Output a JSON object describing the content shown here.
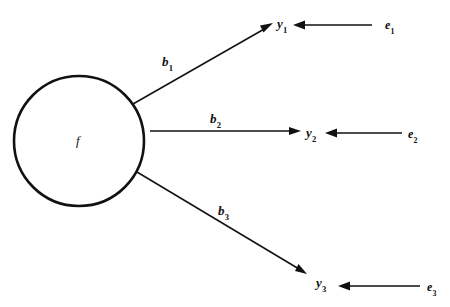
{
  "diagram": {
    "type": "path-diagram",
    "background_color": "#ffffff",
    "stroke_color": "#111111",
    "factor": {
      "name": "f",
      "label": "f",
      "shape": "circle",
      "cx": 79,
      "cy": 141,
      "r": 65,
      "stroke_width": 2.6
    },
    "loadings": [
      {
        "name": "b1",
        "label": "b",
        "subscript": "1",
        "from": "f",
        "to": "y1",
        "x1": 133,
        "y1": 104,
        "x2": 273,
        "y2": 23,
        "label_x": 162,
        "label_y": 55
      },
      {
        "name": "b2",
        "label": "b",
        "subscript": "2",
        "from": "f",
        "to": "y2",
        "x1": 150,
        "y1": 131,
        "x2": 301,
        "y2": 131,
        "label_x": 210,
        "label_y": 112
      },
      {
        "name": "b3",
        "label": "b",
        "subscript": "3",
        "from": "f",
        "to": "y3",
        "x1": 137,
        "y1": 172,
        "x2": 307,
        "y2": 274,
        "label_x": 218,
        "label_y": 204
      }
    ],
    "indicators": [
      {
        "name": "y1",
        "label": "y",
        "subscript": "1",
        "x": 277,
        "y": 17
      },
      {
        "name": "y2",
        "label": "y",
        "subscript": "2",
        "x": 306,
        "y": 126
      },
      {
        "name": "y3",
        "label": "y",
        "subscript": "3",
        "x": 316,
        "y": 276
      }
    ],
    "errors": [
      {
        "name": "e1",
        "label": "e",
        "subscript": "1",
        "x": 385,
        "y": 19
      },
      {
        "name": "e2",
        "label": "e",
        "subscript": "2",
        "x": 408,
        "y": 128
      },
      {
        "name": "e3",
        "label": "e",
        "subscript": "3",
        "x": 427,
        "y": 281
      }
    ],
    "error_arrows": [
      {
        "name": "e1-to-y1",
        "from": "e1",
        "to": "y1",
        "x1": 372,
        "y1": 25,
        "x2": 293,
        "y2": 25
      },
      {
        "name": "e2-to-y2",
        "from": "e2",
        "to": "y2",
        "x1": 402,
        "y1": 133,
        "x2": 325,
        "y2": 133
      },
      {
        "name": "e3-to-y3",
        "from": "e3",
        "to": "y3",
        "x1": 420,
        "y1": 286,
        "x2": 338,
        "y2": 286
      }
    ]
  }
}
